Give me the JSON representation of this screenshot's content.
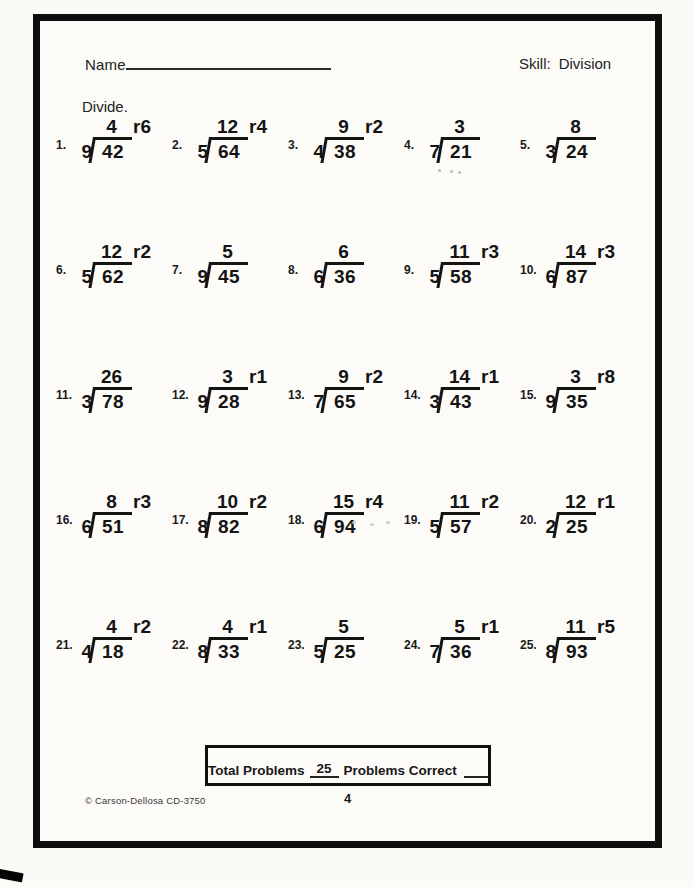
{
  "header": {
    "name_label": "Name",
    "skill_label": "Skill:",
    "skill_value": "Division"
  },
  "instruction": "Divide.",
  "problems": [
    {
      "num": "1.",
      "divisor": "9",
      "dividend": "42",
      "quotient": "4",
      "remainder": "r6"
    },
    {
      "num": "2.",
      "divisor": "5",
      "dividend": "64",
      "quotient": "12",
      "remainder": "r4"
    },
    {
      "num": "3.",
      "divisor": "4",
      "dividend": "38",
      "quotient": "9",
      "remainder": "r2"
    },
    {
      "num": "4.",
      "divisor": "7",
      "dividend": "21",
      "quotient": "3",
      "remainder": ""
    },
    {
      "num": "5.",
      "divisor": "3",
      "dividend": "24",
      "quotient": "8",
      "remainder": ""
    },
    {
      "num": "6.",
      "divisor": "5",
      "dividend": "62",
      "quotient": "12",
      "remainder": "r2"
    },
    {
      "num": "7.",
      "divisor": "9",
      "dividend": "45",
      "quotient": "5",
      "remainder": ""
    },
    {
      "num": "8.",
      "divisor": "6",
      "dividend": "36",
      "quotient": "6",
      "remainder": ""
    },
    {
      "num": "9.",
      "divisor": "5",
      "dividend": "58",
      "quotient": "11",
      "remainder": "r3"
    },
    {
      "num": "10.",
      "divisor": "6",
      "dividend": "87",
      "quotient": "14",
      "remainder": "r3"
    },
    {
      "num": "11.",
      "divisor": "3",
      "dividend": "78",
      "quotient": "26",
      "remainder": ""
    },
    {
      "num": "12.",
      "divisor": "9",
      "dividend": "28",
      "quotient": "3",
      "remainder": "r1"
    },
    {
      "num": "13.",
      "divisor": "7",
      "dividend": "65",
      "quotient": "9",
      "remainder": "r2"
    },
    {
      "num": "14.",
      "divisor": "3",
      "dividend": "43",
      "quotient": "14",
      "remainder": "r1"
    },
    {
      "num": "15.",
      "divisor": "9",
      "dividend": "35",
      "quotient": "3",
      "remainder": "r8"
    },
    {
      "num": "16.",
      "divisor": "6",
      "dividend": "51",
      "quotient": "8",
      "remainder": "r3"
    },
    {
      "num": "17.",
      "divisor": "8",
      "dividend": "82",
      "quotient": "10",
      "remainder": "r2"
    },
    {
      "num": "18.",
      "divisor": "6",
      "dividend": "94",
      "quotient": "15",
      "remainder": "r4"
    },
    {
      "num": "19.",
      "divisor": "5",
      "dividend": "57",
      "quotient": "11",
      "remainder": "r2"
    },
    {
      "num": "20.",
      "divisor": "2",
      "dividend": "25",
      "quotient": "12",
      "remainder": "r1"
    },
    {
      "num": "21.",
      "divisor": "4",
      "dividend": "18",
      "quotient": "4",
      "remainder": "r2"
    },
    {
      "num": "22.",
      "divisor": "8",
      "dividend": "33",
      "quotient": "4",
      "remainder": "r1"
    },
    {
      "num": "23.",
      "divisor": "5",
      "dividend": "25",
      "quotient": "5",
      "remainder": ""
    },
    {
      "num": "24.",
      "divisor": "7",
      "dividend": "36",
      "quotient": "5",
      "remainder": "r1"
    },
    {
      "num": "25.",
      "divisor": "8",
      "dividend": "93",
      "quotient": "11",
      "remainder": "r5"
    }
  ],
  "footer": {
    "total_problems_label": "Total Problems",
    "total_problems_value": "25",
    "problems_correct_label": "Problems Correct",
    "copyright": "© Carson-Dellosa CD-3750",
    "page_number": "4"
  },
  "colors": {
    "ink": "#141414",
    "border": "#0e0e0e",
    "paper": "#fcfbf8"
  }
}
